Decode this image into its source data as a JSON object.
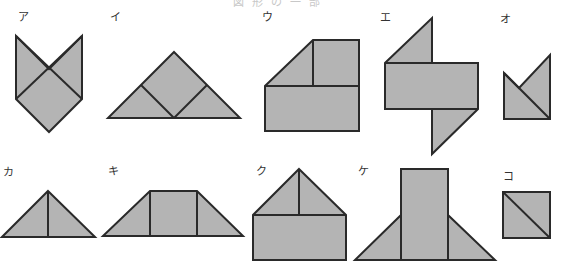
{
  "header": {
    "title_fragment": "図形の一部"
  },
  "colors": {
    "fill": "#b4b4b4",
    "stroke": "#2a2a2a",
    "background": "#ffffff"
  },
  "figures": [
    {
      "id": "a",
      "label": "ア"
    },
    {
      "id": "i",
      "label": "イ"
    },
    {
      "id": "u",
      "label": "ウ"
    },
    {
      "id": "e",
      "label": "エ"
    },
    {
      "id": "o",
      "label": "オ"
    },
    {
      "id": "ka",
      "label": "カ"
    },
    {
      "id": "ki",
      "label": "キ"
    },
    {
      "id": "ku",
      "label": "ク"
    },
    {
      "id": "ke",
      "label": "ケ"
    },
    {
      "id": "ko",
      "label": "コ"
    }
  ]
}
